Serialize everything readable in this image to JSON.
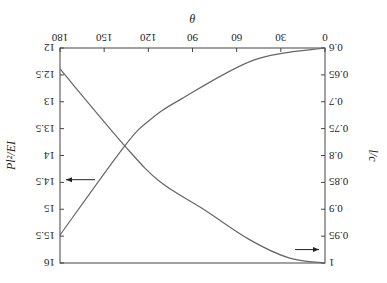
{
  "chart_data": {
    "type": "line",
    "orientation_note": "image displayed rotated 180 degrees",
    "title": "",
    "xlabel": "θ",
    "x_ticks": [
      0,
      30,
      60,
      90,
      120,
      150,
      180
    ],
    "xlim": [
      0,
      180
    ],
    "y_left": {
      "label": "Pl²/EI",
      "ticks": [
        "12",
        "12.5",
        "13",
        "13.5",
        "14",
        "14.5",
        "15",
        "15.5",
        "16"
      ],
      "lim": [
        12,
        16
      ]
    },
    "y_right": {
      "label": "l/c",
      "ticks": [
        "0.6",
        "0.65",
        "0.7",
        "0.75",
        "0.8",
        "0.85",
        "0.9",
        "0.95",
        "1"
      ],
      "lim": [
        0.6,
        1.0
      ]
    },
    "series": [
      {
        "name": "Pl²/EI",
        "axis": "left",
        "x": [
          0,
          48,
          99,
          119,
          136,
          180
        ],
        "values": [
          12.0,
          12.22,
          12.97,
          13.34,
          13.82,
          15.48
        ]
      },
      {
        "name": "l/c",
        "axis": "right",
        "x": [
          0,
          24,
          51,
          82,
          112,
          136,
          180
        ],
        "values": [
          1.0,
          0.991,
          0.957,
          0.901,
          0.849,
          0.782,
          0.639
        ]
      }
    ],
    "annotations": [
      {
        "type": "arrow",
        "direction": "to-left-axis",
        "series": "Pl²/EI",
        "at_y": 14.45
      },
      {
        "type": "arrow",
        "direction": "to-right-axis",
        "series": "l/c",
        "at_y": 0.975
      }
    ],
    "grid": false,
    "legend": "none"
  }
}
